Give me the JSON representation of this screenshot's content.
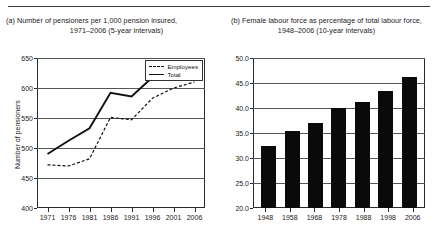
{
  "figure": {
    "panel_a": {
      "label": "(a)",
      "title_line1": "(a) Number of pensioners per 1,000 pension insured,",
      "title_line2": "1971–2006 (5-year intervals)"
    },
    "panel_b": {
      "label": "(b)",
      "title_line1": "(b) Female labour force as percentage of total labour force,",
      "title_line2": "1948–2006 (10-year intervals)"
    }
  },
  "chart_data": [
    {
      "type": "line",
      "title": "(a) Number of pensioners per 1,000 pension insured, 1971–2006 (5-year intervals)",
      "xlabel": "",
      "ylabel": "Number of pensioners",
      "x": [
        "1971",
        "1976",
        "1981",
        "1986",
        "1991",
        "1996",
        "2001",
        "2006"
      ],
      "ylim": [
        400,
        650
      ],
      "yticks": [
        400,
        450,
        500,
        550,
        600,
        650
      ],
      "ytick_labels": [
        "400",
        "450",
        "500",
        "550",
        "600",
        "650"
      ],
      "grid": true,
      "legend_position": "top-right",
      "series": [
        {
          "name": "Employees",
          "style": "dashed",
          "color": "#111111",
          "values": [
            472,
            470,
            482,
            551,
            547,
            583,
            600,
            610
          ]
        },
        {
          "name": "Total",
          "style": "solid",
          "color": "#111111",
          "values": [
            490,
            512,
            533,
            592,
            586,
            618,
            623,
            624
          ]
        }
      ]
    },
    {
      "type": "bar",
      "title": "(b) Female labour force as percentage of total labour force, 1948–2006 (10-year intervals)",
      "xlabel": "",
      "ylabel": "",
      "categories": [
        "1948",
        "1958",
        "1968",
        "1978",
        "1988",
        "1998",
        "2006"
      ],
      "values": [
        32.5,
        35.5,
        37.0,
        40.0,
        41.3,
        43.5,
        46.3
      ],
      "ylim": [
        20.0,
        50.0
      ],
      "yticks": [
        20.0,
        25.0,
        30.0,
        35.0,
        40.0,
        45.0,
        50.0
      ],
      "ytick_labels": [
        "20.0",
        "25.0",
        "30.0",
        "35.0",
        "40.0",
        "45.0",
        "50.0"
      ],
      "grid": true,
      "bar_color": "#0a0a0a"
    }
  ]
}
